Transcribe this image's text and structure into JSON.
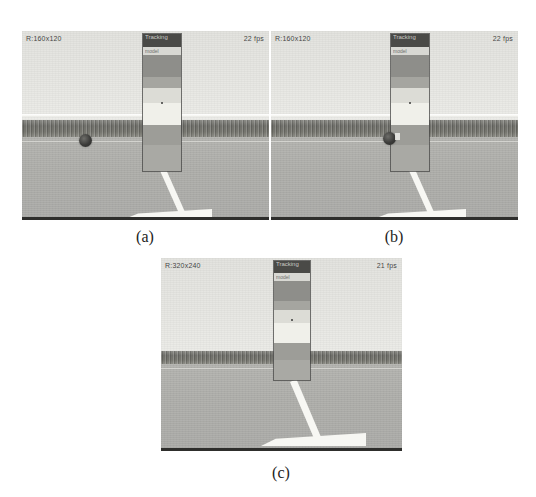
{
  "figure": {
    "panels": [
      {
        "id": "a",
        "caption": "(a)",
        "hud": {
          "resolution": "R:160x120",
          "framerate": "22 fps"
        },
        "track_window": {
          "label": "Tracking",
          "sublabel": "model",
          "bands": [
            "dark",
            "light",
            "mid-grey",
            "lighter-grey",
            "bright",
            "brightest",
            "lower-grey",
            "bottom-grey"
          ]
        },
        "blob": {
          "present": true,
          "position": "road-left"
        }
      },
      {
        "id": "b",
        "caption": "(b)",
        "hud": {
          "resolution": "R:160x120",
          "framerate": "22 fps"
        },
        "track_window": {
          "label": "Tracking",
          "sublabel": "model",
          "bands": [
            "dark",
            "light",
            "mid-grey",
            "lighter-grey",
            "bright",
            "brightest",
            "lower-grey",
            "bottom-grey"
          ]
        },
        "blob": {
          "present": true,
          "position": "at-window-edge"
        }
      },
      {
        "id": "c",
        "caption": "(c)",
        "hud": {
          "resolution": "R:320x240",
          "framerate": "21 fps"
        },
        "track_window": {
          "label": "Tracking",
          "sublabel": "model",
          "bands": [
            "dark",
            "light",
            "mid-grey",
            "lighter-grey",
            "bright",
            "brightest",
            "lower-grey",
            "bottom-grey"
          ]
        },
        "blob": {
          "present": false,
          "position": "none"
        }
      }
    ],
    "colors": {
      "sky": "#e7e7e3",
      "hedge": "#6f6f6a",
      "road": "#b0b0ac",
      "path_marking": "#f7f7f3",
      "overlay_border": "#46464 4",
      "hud_text": "#2b2b29",
      "caption_text": "#1d1d1b",
      "page_background": "#ffffff"
    }
  }
}
